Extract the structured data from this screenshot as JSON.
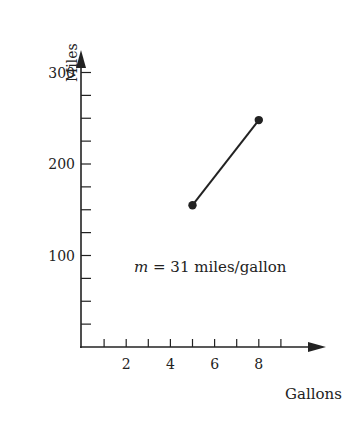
{
  "chart_data": {
    "type": "line",
    "title": "",
    "xlabel": "Gallons",
    "ylabel": "Miles",
    "xlim": [
      0,
      10
    ],
    "ylim": [
      0,
      340
    ],
    "x_ticks": [
      1,
      2,
      3,
      4,
      5,
      6,
      7,
      8,
      9
    ],
    "x_tick_labels": [
      "",
      "2",
      "",
      "4",
      "",
      "6",
      "",
      "8",
      ""
    ],
    "y_ticks": [
      25,
      50,
      75,
      100,
      125,
      150,
      175,
      200,
      225,
      250,
      275,
      300
    ],
    "y_tick_labels": [
      "",
      "",
      "",
      "100",
      "",
      "",
      "",
      "200",
      "",
      "",
      "",
      "300"
    ],
    "grid": false,
    "series": [
      {
        "name": "segment",
        "x": [
          5,
          8
        ],
        "y": [
          155,
          248
        ],
        "markers": true,
        "color": "#222222"
      }
    ],
    "annotations": [
      {
        "text_var": "m",
        "text_rest": " = 31 miles/gallon",
        "x": 5.4,
        "y": 100
      }
    ]
  }
}
